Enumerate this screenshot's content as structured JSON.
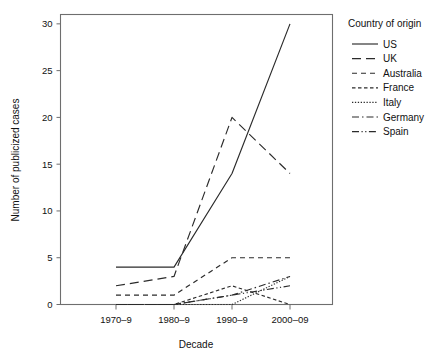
{
  "chart_data": {
    "type": "line",
    "title": "",
    "subtitle": "",
    "xlabel": "Decade",
    "ylabel": "Number of publicized cases",
    "categories": [
      "1970–9",
      "1980–9",
      "1990–9",
      "2000–09"
    ],
    "xtick_labels": [
      "1970–9",
      "1980–9",
      "1990–9",
      "2000–09"
    ],
    "ytick_labels": [
      "0",
      "5",
      "10",
      "15",
      "20",
      "25",
      "30"
    ],
    "ytick_values": [
      0,
      5,
      10,
      15,
      20,
      25,
      30
    ],
    "ylim": [
      0,
      31
    ],
    "xlim": [
      -0.55,
      3.55
    ],
    "grid": false,
    "legend_position": "right",
    "legend_title": "Country of origin",
    "series": [
      {
        "name": "US",
        "values": [
          4,
          4,
          14,
          30
        ],
        "dash": "none",
        "color": "#2b2b2b"
      },
      {
        "name": "UK",
        "values": [
          2,
          3,
          20,
          14
        ],
        "dash": "9,5",
        "color": "#2b2b2b"
      },
      {
        "name": "Australia",
        "values": [
          1,
          1,
          5,
          5
        ],
        "dash": "5,4",
        "color": "#2b2b2b"
      },
      {
        "name": "France",
        "values": [
          0,
          0,
          2,
          0
        ],
        "dash": "3.5,2.5",
        "color": "#2b2b2b"
      },
      {
        "name": "Italy",
        "values": [
          0,
          0,
          0,
          3
        ],
        "dash": "1.3,1.6",
        "color": "#2b2b2b"
      },
      {
        "name": "Germany",
        "values": [
          0,
          0,
          1,
          3
        ],
        "dash": "7,3,1.5,3",
        "color": "#2b2b2b"
      },
      {
        "name": "Spain",
        "values": [
          0,
          0,
          1,
          2
        ],
        "dash": "7,2.5,1.2,2.5,1.2,2.5",
        "color": "#2b2b2b"
      }
    ]
  },
  "legend": {
    "title": "Country of origin",
    "entries": [
      {
        "label": "US"
      },
      {
        "label": "UK"
      },
      {
        "label": "Australia"
      },
      {
        "label": "France"
      },
      {
        "label": "Italy"
      },
      {
        "label": "Germany"
      },
      {
        "label": "Spain"
      }
    ]
  },
  "axes": {
    "y_title": "Number of publicized cases",
    "x_title": "Decade"
  }
}
